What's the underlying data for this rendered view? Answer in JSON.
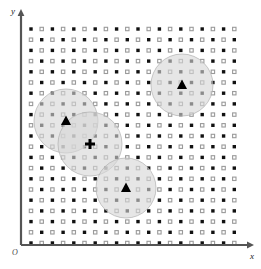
{
  "figure": {
    "background_color": "#ffffff",
    "width": 261,
    "height": 269
  },
  "axes": {
    "x_label": "x",
    "y_label": "y",
    "origin_label": "O",
    "axis_color": "#555555",
    "axis_line_width": 2.2,
    "x_axis": {
      "y": 245,
      "x_start": 21,
      "x_end": 247
    },
    "y_axis": {
      "x": 21,
      "y_start": 245,
      "y_end": 16
    },
    "arrow_color": "#555555"
  },
  "chart_data": {
    "type": "scatter",
    "title": "",
    "xlabel": "x",
    "ylabel": "y",
    "grid": false,
    "legend": "none",
    "grid_points": {
      "x_start": 31,
      "y_start": 29,
      "spacing": 10.7,
      "cols": 20,
      "rows": 21,
      "pattern": "checkerboard",
      "classes": [
        {
          "name": "filled-dot",
          "marker": "filled-square",
          "color": "#111111",
          "size": 3.4
        },
        {
          "name": "hollow-dot",
          "marker": "open-square",
          "color": "#9a9a9a",
          "size": 3.4
        }
      ]
    },
    "circles": [
      {
        "name": "neighborhood-top-right",
        "cx": 182,
        "cy": 85,
        "r": 31,
        "fill": "#d6d6d6",
        "fill_opacity": 0.62,
        "stroke": "#b0b0b0"
      },
      {
        "name": "neighborhood-left",
        "cx": 66,
        "cy": 121,
        "r": 32,
        "fill": "#d6d6d6",
        "fill_opacity": 0.62,
        "stroke": "#b0b0b0"
      },
      {
        "name": "neighborhood-middle",
        "cx": 90,
        "cy": 144,
        "r": 32,
        "fill": "#d6d6d6",
        "fill_opacity": 0.62,
        "stroke": "#b0b0b0"
      },
      {
        "name": "neighborhood-bottom",
        "cx": 126,
        "cy": 188,
        "r": 30,
        "fill": "#d6d6d6",
        "fill_opacity": 0.62,
        "stroke": "#b0b0b0"
      }
    ],
    "markers": [
      {
        "name": "prototype-top-right",
        "type": "triangle",
        "x": 182,
        "y": 85,
        "color": "#000000",
        "size": 7
      },
      {
        "name": "prototype-left",
        "type": "triangle",
        "x": 66,
        "y": 121,
        "color": "#000000",
        "size": 7
      },
      {
        "name": "prototype-bottom",
        "type": "triangle",
        "x": 126,
        "y": 188,
        "color": "#000000",
        "size": 7
      },
      {
        "name": "query-point",
        "type": "cross",
        "x": 90,
        "y": 144,
        "color": "#000000",
        "size": 5
      }
    ]
  }
}
